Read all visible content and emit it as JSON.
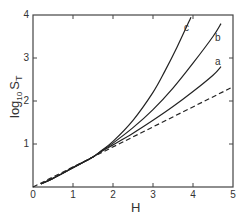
{
  "chart_data": {
    "type": "line",
    "title": "",
    "xlabel": "H",
    "ylabel": "log10 ST",
    "ylabel_parts": {
      "main": "log",
      "sub": "10",
      "var": "S",
      "var_sub": "T"
    },
    "xlim": [
      0,
      5
    ],
    "ylim": [
      0,
      4
    ],
    "xticks": [
      "0",
      "1",
      "2",
      "3",
      "4",
      "5"
    ],
    "yticks": [
      "1",
      "2",
      "3",
      "4"
    ],
    "grid": false,
    "legend": "none (curves labeled inline)",
    "series": [
      {
        "name": "a",
        "style": "solid",
        "x": [
          0.2,
          0.5,
          1.0,
          1.5,
          1.7,
          2.0,
          2.5,
          3.0,
          3.5,
          4.0,
          4.5,
          4.7
        ],
        "y": [
          0.07,
          0.2,
          0.45,
          0.7,
          0.82,
          0.98,
          1.25,
          1.55,
          1.87,
          2.22,
          2.6,
          2.8
        ]
      },
      {
        "name": "b",
        "style": "solid",
        "x": [
          0.2,
          0.5,
          1.0,
          1.5,
          1.7,
          2.0,
          2.5,
          3.0,
          3.5,
          4.0,
          4.5,
          4.7
        ],
        "y": [
          0.07,
          0.2,
          0.45,
          0.7,
          0.83,
          1.02,
          1.38,
          1.8,
          2.3,
          2.88,
          3.5,
          3.8
        ]
      },
      {
        "name": "c",
        "style": "solid",
        "x": [
          0.2,
          0.5,
          1.0,
          1.5,
          1.7,
          2.0,
          2.5,
          3.0,
          3.3,
          3.6,
          3.95
        ],
        "y": [
          0.07,
          0.2,
          0.45,
          0.7,
          0.84,
          1.06,
          1.55,
          2.2,
          2.7,
          3.25,
          3.95
        ]
      },
      {
        "name": "asymptote",
        "style": "dashed",
        "x": [
          0,
          5
        ],
        "y": [
          0,
          2.33
        ]
      }
    ]
  },
  "labels": {
    "curve_a": "a",
    "curve_b": "b",
    "curve_c": "c",
    "xlabel": "H",
    "ylabel_log": "log",
    "ylabel_sub": "10",
    "ylabel_var": "S",
    "ylabel_var_sub": "T"
  }
}
